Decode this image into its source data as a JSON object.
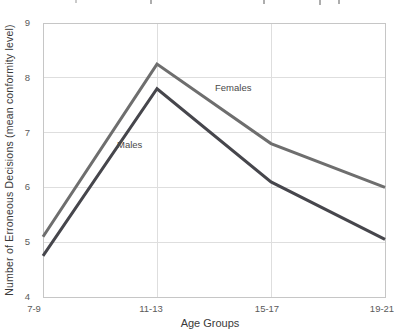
{
  "chart_data": {
    "type": "line",
    "title": "",
    "categories": [
      "7-9",
      "11-13",
      "15-17",
      "19-21"
    ],
    "series": [
      {
        "name": "Females",
        "values": [
          5.1,
          8.25,
          6.8,
          6.0
        ],
        "color": "#6e6e6e"
      },
      {
        "name": "Males",
        "values": [
          4.75,
          7.8,
          6.1,
          5.05
        ],
        "color": "#46464c"
      }
    ],
    "xlabel": "Age Groups",
    "ylabel": "Number of Erroneous Decisions (mean conformity level)",
    "ylim": [
      4,
      9
    ],
    "yticks": [
      4,
      5,
      6,
      7,
      8,
      9
    ],
    "grid": true,
    "legend": "inline-labels"
  },
  "colors": {
    "background": "#ffffff",
    "plot_border": "#c6c6c6",
    "gridline": "#dedede",
    "tick_text": "#5a5a5a",
    "axis_title_text": "#3a3a3a",
    "series_label_text": "#4a4a4a"
  }
}
